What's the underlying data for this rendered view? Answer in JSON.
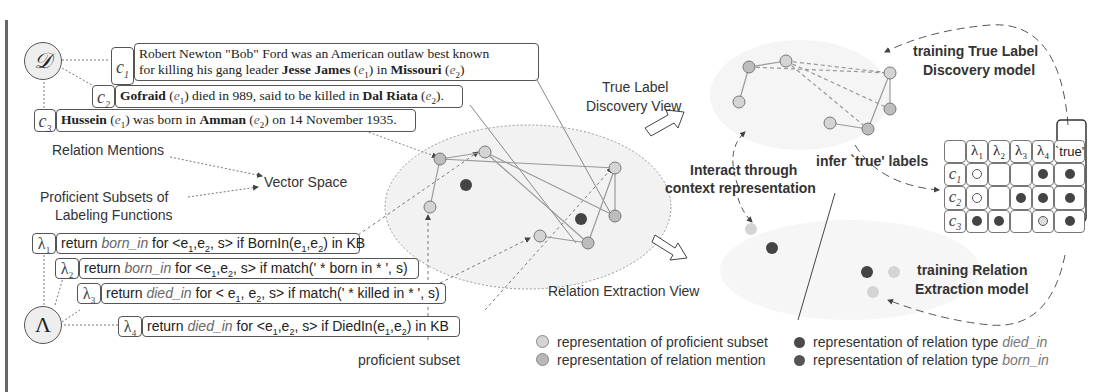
{
  "dataset_symbol": "𝒟",
  "lf_symbol": "Λ",
  "mentions": [
    {
      "tag": "c",
      "sub": "1",
      "lines": [
        [
          {
            "t": "Robert Newton \"Bob\" Ford was an American outlaw best known"
          }
        ],
        [
          {
            "t": "for killing his gang leader "
          },
          {
            "t": "Jesse James",
            "b": true
          },
          {
            "t": " ("
          },
          {
            "t": "e",
            "i": true
          },
          {
            "t": "1",
            "s": true
          },
          {
            "t": ") in "
          },
          {
            "t": "Missouri",
            "b": true
          },
          {
            "t": " ("
          },
          {
            "t": "e",
            "i": true
          },
          {
            "t": "2",
            "s": true
          },
          {
            "t": ")"
          }
        ]
      ]
    },
    {
      "tag": "c",
      "sub": "2",
      "lines": [
        [
          {
            "t": "Gofraid",
            "b": true
          },
          {
            "t": " ("
          },
          {
            "t": "e",
            "i": true
          },
          {
            "t": "1",
            "s": true
          },
          {
            "t": ") died in 989, said to be killed in "
          },
          {
            "t": "Dal Riata",
            "b": true
          },
          {
            "t": " ("
          },
          {
            "t": "e",
            "i": true
          },
          {
            "t": "2",
            "s": true
          },
          {
            "t": ")."
          }
        ]
      ]
    },
    {
      "tag": "c",
      "sub": "3",
      "lines": [
        [
          {
            "t": "Hussein",
            "b": true
          },
          {
            "t": " ("
          },
          {
            "t": "e",
            "i": true
          },
          {
            "t": "1",
            "s": true
          },
          {
            "t": ") was born in "
          },
          {
            "t": "Amman",
            "b": true
          },
          {
            "t": " ("
          },
          {
            "t": "e",
            "i": true
          },
          {
            "t": "2",
            "s": true
          },
          {
            "t": ") on 14 November 1935."
          }
        ]
      ]
    }
  ],
  "labeling_functions": [
    {
      "tag": "λ",
      "sub": "1",
      "parts": [
        {
          "t": "return "
        },
        {
          "t": "born_in",
          "i": true
        },
        {
          "t": " for <e"
        },
        {
          "t": "1",
          "s": true
        },
        {
          "t": ",e"
        },
        {
          "t": "2",
          "s": true
        },
        {
          "t": ", s> if BornIn(e"
        },
        {
          "t": "1",
          "s": true
        },
        {
          "t": ",e"
        },
        {
          "t": "2",
          "s": true
        },
        {
          "t": ") in KB"
        }
      ]
    },
    {
      "tag": "λ",
      "sub": "2",
      "parts": [
        {
          "t": "return "
        },
        {
          "t": "born_in",
          "i": true
        },
        {
          "t": " for <e"
        },
        {
          "t": "1",
          "s": true
        },
        {
          "t": ",e"
        },
        {
          "t": "2",
          "s": true
        },
        {
          "t": ", s> if match(' * born in * ', s)"
        }
      ]
    },
    {
      "tag": "λ",
      "sub": "3",
      "parts": [
        {
          "t": "return "
        },
        {
          "t": "died_in",
          "i": true
        },
        {
          "t": " for < e"
        },
        {
          "t": "1",
          "s": true
        },
        {
          "t": ", e"
        },
        {
          "t": "2",
          "s": true
        },
        {
          "t": ", s> if match(' * killed in * ', s)"
        }
      ]
    },
    {
      "tag": "λ",
      "sub": "4",
      "parts": [
        {
          "t": "return "
        },
        {
          "t": "died_in",
          "i": true
        },
        {
          "t": " for <e"
        },
        {
          "t": "1",
          "s": true
        },
        {
          "t": ",e"
        },
        {
          "t": "2",
          "s": true
        },
        {
          "t": ", s> if DiedIn(e"
        },
        {
          "t": "1",
          "s": true
        },
        {
          "t": ",e"
        },
        {
          "t": "2",
          "s": true
        },
        {
          "t": ") in KB"
        }
      ]
    }
  ],
  "labels": {
    "relation_mentions": "Relation Mentions",
    "vector_space": "Vector Space",
    "proficient_subsets_1": "Proficient Subsets of",
    "proficient_subsets_2": "Labeling Functions",
    "true_label_view_1": "True Label",
    "true_label_view_2": "Discovery View",
    "relation_extraction_view": "Relation Extraction View",
    "interact_1": "Interact through",
    "interact_2": "context representation",
    "infer_true": "infer `true' labels",
    "training_tld_1": "training True Label",
    "training_tld_2": "Discovery model",
    "training_re_1": "training Relation",
    "training_re_2": "Extraction model",
    "proficient_subset": "proficient subset"
  },
  "matrix": {
    "headers": [
      "",
      "λ1",
      "λ2",
      "λ3",
      "λ4",
      "`true'"
    ],
    "rows": [
      {
        "label": "c1",
        "cells": [
          "empty",
          "",
          "",
          "filled",
          "filled"
        ]
      },
      {
        "label": "c2",
        "cells": [
          "empty",
          "",
          "filled",
          "filled",
          "filled"
        ]
      },
      {
        "label": "c3",
        "cells": [
          "filled",
          "filled",
          "",
          "light",
          "filled"
        ]
      }
    ]
  },
  "legend": [
    {
      "text": "representation of proficient subset",
      "color": "#d4d4d4"
    },
    {
      "text": "representation of relation mention",
      "color": "#b8b8b8"
    },
    {
      "text_prefix": "representation of relation type ",
      "text_italic": "died_in",
      "color": "#4a4a4a"
    },
    {
      "text_prefix": "representation of relation type ",
      "text_italic": "born_in",
      "color": "#555555"
    }
  ],
  "colors": {
    "node_fill": "#c8c8c8",
    "node_light": "#dadada",
    "dark_node": "#444444",
    "ellipse_fill": "#f0f0f0",
    "line": "#888888"
  }
}
